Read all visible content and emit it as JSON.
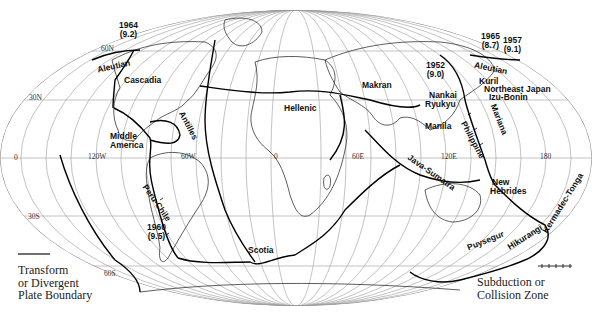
{
  "figure": {
    "type": "world-map",
    "projection": "Mollweide-style elliptical"
  },
  "grid_labels": {
    "lat_60n": "60N",
    "lat_30n": "30N",
    "lat_0": "0",
    "lat_30s": "30S",
    "lat_60s": "60S",
    "lon_120w": "120W",
    "lon_60w": "60W",
    "lon_0": "0",
    "lon_60e": "60E",
    "lon_120e": "120E",
    "lon_180": "180"
  },
  "regions": {
    "aleutian_west": "Aleutian",
    "cascadia": "Cascadia",
    "middle_america_1": "Middle",
    "middle_america_2": "America",
    "antilles": "Antilles",
    "peru_chile": "Peru-Chile",
    "scotia": "Scotia",
    "hellenic": "Hellenic",
    "makran": "Makran",
    "aleutian_east": "Aleutian",
    "kuril": "Kuril",
    "northeast_japan": "Northeast Japan",
    "izu_bonin": "Izu-Bonin",
    "nankai": "Nankai",
    "ryukyu": "Ryukyu",
    "manila": "Manila",
    "philippine": "Philippine",
    "mariana": "Mariana",
    "java_sumatra": "Java-Sumatra",
    "new_hebrides_1": "New",
    "new_hebrides_2": "Hebrides",
    "kermadec_tonga": "Kermadec-Tonga",
    "hikurangi": "Hikurangi",
    "puysegur": "Puysegur"
  },
  "earthquakes": [
    {
      "year": "1964",
      "magnitude": "(9.2)"
    },
    {
      "year": "1952",
      "magnitude": "(9.0)"
    },
    {
      "year": "1965",
      "magnitude": "(8.7)"
    },
    {
      "year": "1957",
      "magnitude": "(9.1)"
    },
    {
      "year": "1960",
      "magnitude": "(9.5)"
    }
  ],
  "legend": {
    "transform": "Transform\nor Divergent\nPlate Boundary",
    "subduction": "Subduction or\nCollision Zone"
  },
  "colors": {
    "boundary": "#000000",
    "grid": "#9a9a9a",
    "coast": "#444444",
    "background": "#ffffff"
  }
}
